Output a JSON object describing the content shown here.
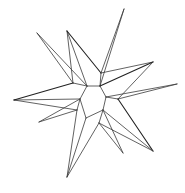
{
  "figure": {
    "background": "#ffffff",
    "line_color": "#3a3a3a",
    "width": 185,
    "height": 193
  },
  "vertices": {
    "A": [
      87,
      86
    ],
    "B": [
      100,
      86
    ],
    "C": [
      106,
      97
    ],
    "D": [
      103,
      110
    ],
    "E": [
      86,
      118
    ],
    "F": [
      80,
      99
    ],
    "G": [
      73,
      83
    ],
    "H": [
      101,
      73
    ],
    "I": [
      118,
      99
    ],
    "J": [
      99,
      123
    ],
    "K": [
      77,
      110
    ],
    "T1": [
      37,
      33
    ],
    "T2": [
      67,
      31
    ],
    "T3": [
      124,
      9
    ],
    "T4": [
      153,
      62
    ],
    "T5": [
      177,
      84
    ],
    "T6": [
      153,
      151
    ],
    "T7": [
      123,
      153
    ],
    "T8": [
      67,
      177
    ],
    "T9": [
      14,
      100
    ],
    "T10": [
      39,
      122
    ]
  },
  "edges": [
    [
      "A",
      "B"
    ],
    [
      "B",
      "C"
    ],
    [
      "C",
      "D"
    ],
    [
      "D",
      "E"
    ],
    [
      "E",
      "F"
    ],
    [
      "F",
      "A"
    ],
    [
      "A",
      "G"
    ],
    [
      "B",
      "H"
    ],
    [
      "C",
      "I"
    ],
    [
      "D",
      "J"
    ],
    [
      "F",
      "K"
    ],
    [
      "T1",
      "G"
    ],
    [
      "T1",
      "A"
    ],
    [
      "T2",
      "G"
    ],
    [
      "T2",
      "A"
    ],
    [
      "T2",
      "H"
    ],
    [
      "T3",
      "H"
    ],
    [
      "T3",
      "B"
    ],
    [
      "T4",
      "H"
    ],
    [
      "T4",
      "B"
    ],
    [
      "T4",
      "I"
    ],
    [
      "T5",
      "I"
    ],
    [
      "T5",
      "C"
    ],
    [
      "T6",
      "I"
    ],
    [
      "T6",
      "D"
    ],
    [
      "T6",
      "J"
    ],
    [
      "T7",
      "J"
    ],
    [
      "T7",
      "D"
    ],
    [
      "T8",
      "J"
    ],
    [
      "T8",
      "E"
    ],
    [
      "T8",
      "K"
    ],
    [
      "T9",
      "K"
    ],
    [
      "T9",
      "F"
    ],
    [
      "T9",
      "G"
    ],
    [
      "T10",
      "K"
    ],
    [
      "T10",
      "F"
    ]
  ],
  "dark_edges": [
    [
      "T2",
      "H"
    ],
    [
      "T4",
      "B"
    ],
    [
      "T6",
      "I"
    ],
    [
      "T9",
      "G"
    ]
  ]
}
